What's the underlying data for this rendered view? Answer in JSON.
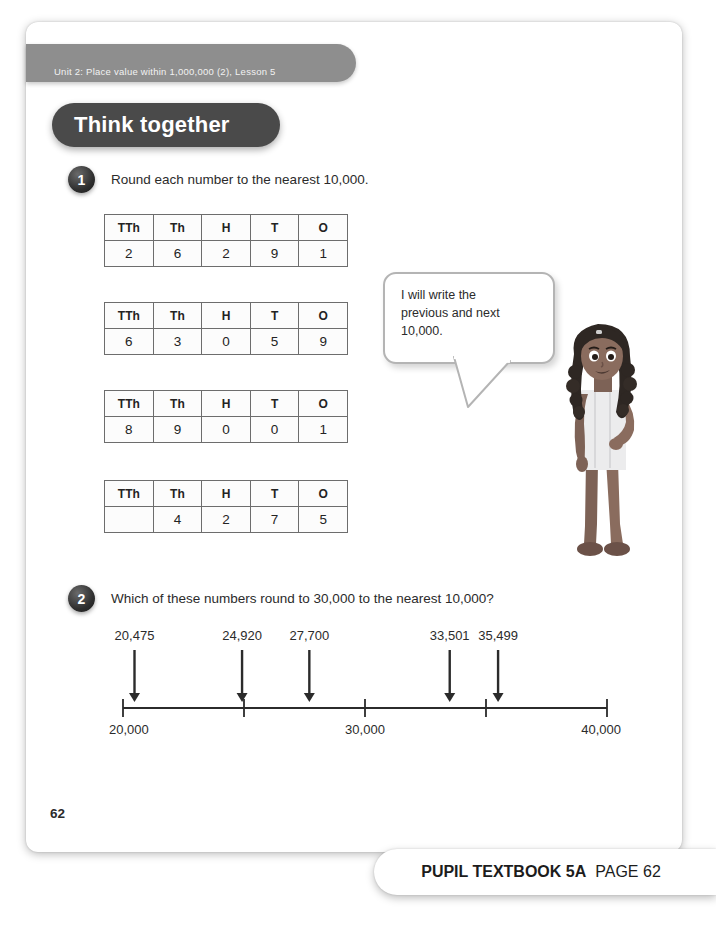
{
  "header": {
    "unit_banner": "Unit 2: Place value within 1,000,000 (2), Lesson 5",
    "section_title": "Think together"
  },
  "questions": [
    {
      "number": "1",
      "prompt": "Round each number to the nearest 10,000."
    },
    {
      "number": "2",
      "prompt": "Which of these numbers round to 30,000 to the nearest 10,000?"
    }
  ],
  "place_value_tables": {
    "columns": [
      "TTh",
      "Th",
      "H",
      "T",
      "O"
    ],
    "rows": [
      [
        "2",
        "6",
        "2",
        "9",
        "1"
      ],
      [
        "6",
        "3",
        "0",
        "5",
        "9"
      ],
      [
        "8",
        "9",
        "0",
        "0",
        "1"
      ],
      [
        "",
        "4",
        "2",
        "7",
        "5"
      ]
    ]
  },
  "speech_bubble": {
    "text": "I will write the\nprevious and next\n10,000."
  },
  "chart_data": {
    "type": "numberline",
    "xlim": [
      20000,
      40000
    ],
    "ticks": [
      20000,
      25000,
      30000,
      35000,
      40000
    ],
    "axis_labels": [
      {
        "value": 20000,
        "label": "20,000"
      },
      {
        "value": 30000,
        "label": "30,000"
      },
      {
        "value": 40000,
        "label": "40,000"
      }
    ],
    "markers": [
      {
        "value": 20475,
        "label": "20,475"
      },
      {
        "value": 24920,
        "label": "24,920"
      },
      {
        "value": 27700,
        "label": "27,700"
      },
      {
        "value": 33501,
        "label": "33,501"
      },
      {
        "value": 35499,
        "label": "35,499"
      }
    ],
    "grid": false,
    "legend": "none"
  },
  "page": {
    "page_number": "62",
    "footer_strong": "PUPIL TEXTBOOK 5A",
    "footer_light": "PAGE 62"
  },
  "colors": {
    "banner_gray": "#8e8e8e",
    "pill_dark": "#4a4a4a",
    "text_dark": "#2b2b2b",
    "table_border": "#6d6d6d",
    "bubble_border": "#b4b4b4"
  }
}
